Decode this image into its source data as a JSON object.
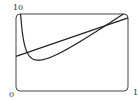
{
  "chart_data": {
    "type": "line",
    "title": "",
    "xlabel": "",
    "ylabel": "",
    "xlim": [
      0,
      10
    ],
    "ylim": [
      0,
      10
    ],
    "grid": false,
    "legend": null,
    "tick_labels": {
      "y_top": "10",
      "origin": "0",
      "x_right": "10"
    },
    "series": [
      {
        "name": "curve",
        "expression": "y = x + 4/x",
        "x": [
          0.4,
          0.5,
          1,
          1.5,
          2,
          3,
          4,
          5,
          6,
          7,
          8,
          9,
          9.6
        ],
        "values": [
          10.4,
          8.5,
          5,
          4.17,
          4,
          4.33,
          5,
          5.8,
          6.67,
          7.57,
          8.5,
          9.44,
          10.02
        ]
      },
      {
        "name": "line",
        "expression": "y = 0.5x + 4.5",
        "x": [
          0,
          10
        ],
        "values": [
          4.5,
          9.5
        ]
      }
    ],
    "intersections": [
      [
        1,
        5
      ],
      [
        8,
        8.5
      ]
    ]
  },
  "colors": {
    "stroke": "#222222",
    "frame": "#444444"
  }
}
